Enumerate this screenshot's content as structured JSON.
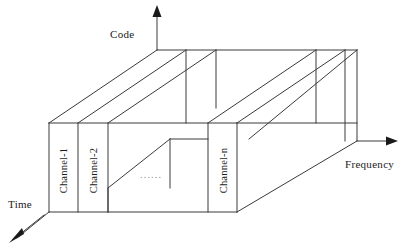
{
  "diagram": {
    "background_color": "#ffffff",
    "line_color": "#3a3a3a",
    "axes": {
      "code": {
        "label": "Code",
        "direction": "up",
        "icon": "arrow-up-icon"
      },
      "frequency": {
        "label": "Frequency",
        "direction": "right",
        "icon": "arrow-right-icon"
      },
      "time": {
        "label": "Time",
        "direction": "down-left",
        "icon": "arrow-down-left-icon"
      }
    },
    "channels": [
      {
        "label": "Channel-1"
      },
      {
        "label": "Channel-2"
      },
      {
        "label": "Channel-n"
      }
    ],
    "ellipsis": "......"
  }
}
